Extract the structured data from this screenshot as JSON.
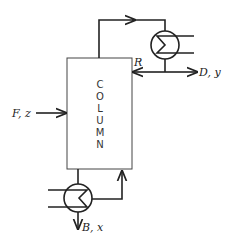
{
  "diagram": {
    "type": "distillation-column-flowsheet",
    "column": {
      "letters": [
        "C",
        "O",
        "L",
        "U",
        "M",
        "N"
      ],
      "label": "COLUMN"
    },
    "streams": {
      "feed": "F, z",
      "reflux": "R",
      "distillate": "D, y",
      "bottoms": "B, x"
    },
    "units": [
      "condenser",
      "reboiler"
    ],
    "colors": {
      "line": "#222222",
      "background": "#ffffff"
    }
  }
}
